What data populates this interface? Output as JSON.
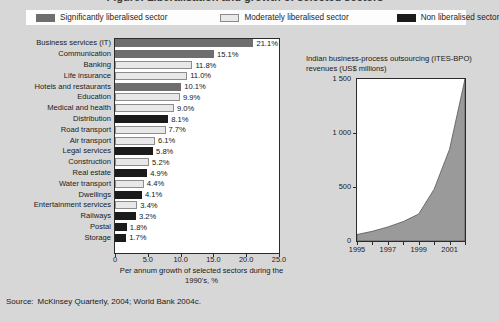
{
  "figure": {
    "partial_title": "Figure: Liberalisation and growth of selected sectors",
    "source_label": "Source:",
    "source_text": "McKinsey Quarterly, 2004; World Bank 2004c."
  },
  "legend": {
    "items": [
      {
        "label": "Significantly liberalised sector",
        "key": "sig",
        "color": "#6e6e6e"
      },
      {
        "label": "Moderately liberalised sector",
        "key": "mod",
        "color": "#e8e8e8"
      },
      {
        "label": "Non liberalised sector",
        "key": "non",
        "color": "#1b1b1b"
      }
    ]
  },
  "chart_data": [
    {
      "type": "bar",
      "orientation": "horizontal",
      "title": "",
      "xlabel": "Per annum growth of selected sectors during the 1990's, %",
      "ylabel": "",
      "xlim": [
        0,
        25
      ],
      "xticks": [
        0,
        5,
        10,
        15,
        20,
        25
      ],
      "xticklabels": [
        "0",
        "5.0",
        "10.0",
        "15.0",
        "20.0",
        "25.0"
      ],
      "grid": false,
      "legend_position": "top",
      "categories": [
        "Business services (IT)",
        "Communication",
        "Banking",
        "Life insurance",
        "Hotels and restaurants",
        "Education",
        "Medical and health",
        "Distribution",
        "Road transport",
        "Air transport",
        "Legal services",
        "Construction",
        "Real estate",
        "Water transport",
        "Dwellings",
        "Entertainment services",
        "Railways",
        "Postal",
        "Storage"
      ],
      "values": [
        21.1,
        15.1,
        11.8,
        11.0,
        10.1,
        9.9,
        9.0,
        8.1,
        7.7,
        6.1,
        5.8,
        5.2,
        4.9,
        4.4,
        4.1,
        3.4,
        3.2,
        1.8,
        1.7
      ],
      "value_labels": [
        "21.1%",
        "15.1%",
        "11.8%",
        "11.0%",
        "10.1%",
        "9.9%",
        "9.0%",
        "8.1%",
        "7.7%",
        "6.1%",
        "5.8%",
        "5.2%",
        "4.9%",
        "4.4%",
        "4.1%",
        "3.4%",
        "3.2%",
        "1.8%",
        "1.7%"
      ],
      "groups": [
        "sig",
        "sig",
        "mod",
        "mod",
        "sig",
        "mod",
        "mod",
        "non",
        "mod",
        "mod",
        "non",
        "mod",
        "non",
        "mod",
        "non",
        "mod",
        "non",
        "non",
        "non"
      ]
    },
    {
      "type": "area",
      "title": "Indian business-process outsourcing (ITES-BPO) revenues (US$ millions)",
      "xlabel": "",
      "ylabel": "",
      "xlim": [
        1995,
        2002
      ],
      "ylim": [
        0,
        1500
      ],
      "yticks": [
        0,
        500,
        1000,
        1500
      ],
      "yticklabels": [
        "0",
        "500",
        "1 000",
        "1 500"
      ],
      "xticks": [
        1995,
        1996,
        1997,
        1998,
        1999,
        2000,
        2001,
        2002
      ],
      "xticklabels": [
        "1995",
        "",
        "1997",
        "",
        "1999",
        "",
        "2001",
        ""
      ],
      "grid": false,
      "x": [
        1995,
        1996,
        1997,
        1998,
        1999,
        2000,
        2001,
        2002
      ],
      "values": [
        60,
        90,
        130,
        180,
        250,
        480,
        850,
        1500
      ],
      "fill_color": "#9a9a9a"
    }
  ]
}
